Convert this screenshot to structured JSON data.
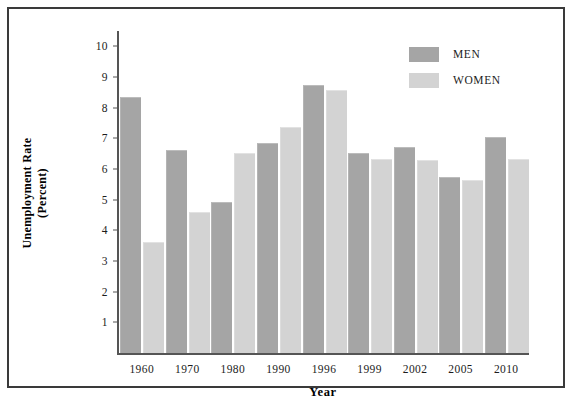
{
  "chart_data": {
    "type": "bar",
    "title": "",
    "xlabel": "Year",
    "ylabel": "Unemployment Rate (Percent)",
    "ylabel_line1": "Unemployment Rate",
    "ylabel_line2": "(Percent)",
    "categories": [
      "1960",
      "1970",
      "1980",
      "1990",
      "1996",
      "1999",
      "2002",
      "2005",
      "2010"
    ],
    "series": [
      {
        "name": "MEN",
        "color": "#a5a5a5",
        "values": [
          8.3,
          6.6,
          4.9,
          6.8,
          8.7,
          6.5,
          6.7,
          5.7,
          7.0
        ]
      },
      {
        "name": "WOMEN",
        "color": "#d3d3d3",
        "values": [
          3.6,
          4.55,
          6.5,
          7.35,
          8.55,
          6.3,
          6.25,
          5.6,
          6.3
        ]
      }
    ],
    "ylim": [
      0,
      10.5
    ],
    "yticks": [
      1,
      2,
      3,
      4,
      5,
      6,
      7,
      8,
      9,
      10
    ],
    "ytick_labels": [
      "1",
      "2",
      "3",
      "4",
      "5",
      "6",
      "7",
      "8",
      "9",
      "10"
    ],
    "grid": false,
    "legend_position": "top-right",
    "legend": [
      "MEN",
      "WOMEN"
    ]
  }
}
